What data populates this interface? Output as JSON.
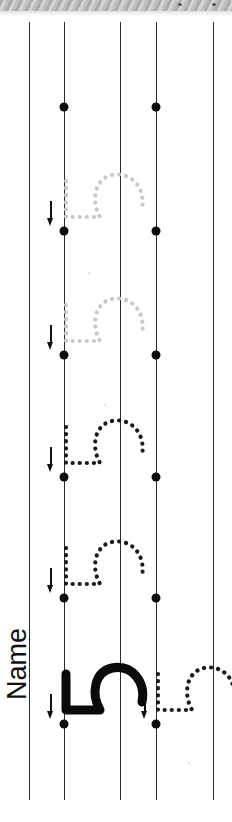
{
  "worksheet": {
    "title": "Number 5 tracing practice worksheet",
    "name_label": "Name",
    "orientation": "page rotated 90 degrees counter-clockwise",
    "target_character": "5",
    "paper_color": "#ffffff",
    "ink_color": "#111111",
    "trace_dark_color": "#1a1a1a",
    "trace_faded_color": "#c9c9c9"
  },
  "scanner_band": {
    "name": "diagonal-striped scan edge",
    "height_px": 11,
    "colors": [
      "#a8a8a8",
      "#d2d2d2",
      "#bdbdbd"
    ],
    "dots": [
      {
        "x": 178,
        "y": 3
      },
      {
        "x": 212,
        "y": 3
      }
    ]
  },
  "rules": [
    {
      "id": "rule-1",
      "x": 29,
      "top": 22,
      "bottom": 800,
      "role": "margin-line"
    },
    {
      "id": "rule-2",
      "x": 64,
      "top": 22,
      "bottom": 800,
      "role": "baseline-upper"
    },
    {
      "id": "rule-3",
      "x": 120,
      "top": 22,
      "bottom": 800,
      "role": "midline"
    },
    {
      "id": "rule-4",
      "x": 156,
      "top": 22,
      "bottom": 800,
      "role": "baseline-lower"
    },
    {
      "id": "rule-5",
      "x": 213,
      "top": 22,
      "bottom": 800,
      "role": "margin-line"
    }
  ],
  "rows": [
    {
      "id": "row-1",
      "dot_y": 107,
      "dots": [
        {
          "x": 64,
          "y": 107
        },
        {
          "x": 156,
          "y": 107
        }
      ],
      "arrow": null,
      "glyphs": []
    },
    {
      "id": "row-2",
      "dot_y": 231,
      "dots": [
        {
          "x": 64,
          "y": 231
        },
        {
          "x": 156,
          "y": 231
        }
      ],
      "arrow": {
        "x": 51,
        "y": 201
      },
      "glyphs": [
        {
          "type": "dotted-5",
          "shade": "faded",
          "x": 64,
          "y": 231
        }
      ]
    },
    {
      "id": "row-3",
      "dot_y": 355,
      "dots": [
        {
          "x": 64,
          "y": 355
        },
        {
          "x": 156,
          "y": 355
        }
      ],
      "arrow": {
        "x": 51,
        "y": 325
      },
      "glyphs": [
        {
          "type": "dotted-5",
          "shade": "faded",
          "x": 64,
          "y": 355
        }
      ]
    },
    {
      "id": "row-4",
      "dot_y": 477,
      "dots": [
        {
          "x": 64,
          "y": 477
        },
        {
          "x": 156,
          "y": 477
        }
      ],
      "arrow": {
        "x": 51,
        "y": 447
      },
      "glyphs": [
        {
          "type": "dotted-5",
          "shade": "dark",
          "x": 64,
          "y": 477
        }
      ]
    },
    {
      "id": "row-5",
      "dot_y": 598,
      "dots": [
        {
          "x": 64,
          "y": 598
        },
        {
          "x": 156,
          "y": 598
        }
      ],
      "arrow": {
        "x": 51,
        "y": 568
      },
      "glyphs": [
        {
          "type": "dotted-5",
          "shade": "dark",
          "x": 64,
          "y": 598
        }
      ]
    },
    {
      "id": "row-6",
      "dot_y": 724,
      "dots": [
        {
          "x": 64,
          "y": 724
        },
        {
          "x": 156,
          "y": 724
        }
      ],
      "arrow": {
        "x": 51,
        "y": 694
      },
      "glyphs": [
        {
          "type": "solid-5",
          "shade": "solid",
          "x": 64,
          "y": 724
        },
        {
          "type": "dotted-5",
          "shade": "dark",
          "x": 156,
          "y": 724
        }
      ]
    },
    {
      "id": "row-6b",
      "dot_y": 724,
      "arrow": {
        "x": 145,
        "y": 694
      },
      "dots": [],
      "glyphs": []
    }
  ],
  "specks": [
    {
      "x": 88,
      "y": 272,
      "w": 2,
      "h": 2
    },
    {
      "x": 104,
      "y": 404,
      "w": 2,
      "h": 2
    },
    {
      "x": 67,
      "y": 424,
      "w": 2,
      "h": 3
    },
    {
      "x": 188,
      "y": 762,
      "w": 2,
      "h": 2
    }
  ]
}
